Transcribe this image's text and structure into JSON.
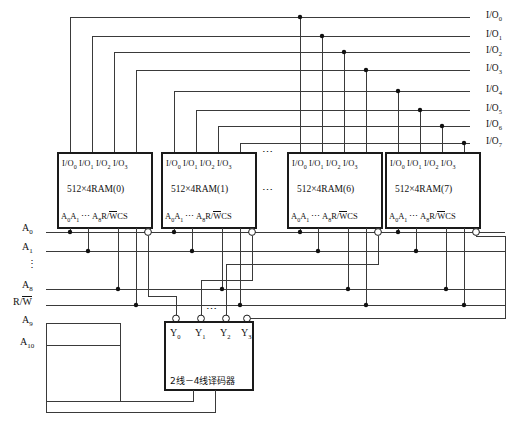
{
  "diagram": {
    "bus_right_labels": [
      {
        "text": "I/O",
        "sub": "0",
        "y": 17
      },
      {
        "text": "I/O",
        "sub": "1",
        "y": 36
      },
      {
        "text": "I/O",
        "sub": "2",
        "y": 52
      },
      {
        "text": "I/O",
        "sub": "3",
        "y": 70
      },
      {
        "text": "I/O",
        "sub": "4",
        "y": 91
      },
      {
        "text": "I/O",
        "sub": "5",
        "y": 110
      },
      {
        "text": "I/O",
        "sub": "6",
        "y": 126
      },
      {
        "text": "I/O",
        "sub": "7",
        "y": 143
      }
    ],
    "left_signals": [
      {
        "text": "A",
        "sub": "0",
        "y": 228,
        "overline": false
      },
      {
        "text": "A",
        "sub": "1",
        "y": 247,
        "overline": false
      },
      {
        "text": "A",
        "sub": "8",
        "y": 285,
        "overline": false
      },
      {
        "text": "R/W",
        "sub": "",
        "y": 302,
        "overline": true
      },
      {
        "text": "A",
        "sub": "9",
        "y": 320,
        "overline": false
      },
      {
        "text": "A",
        "sub": "10",
        "y": 342,
        "overline": false
      }
    ],
    "left_vertical_dots": {
      "glyph": "⋮",
      "y": 265
    },
    "rams": [
      {
        "index": "0",
        "label": "512×4RAM(0)",
        "x": 58,
        "y": 153,
        "w": 94,
        "h": 75
      },
      {
        "index": "1",
        "label": "512×4RAM(1)",
        "x": 162,
        "y": 153,
        "w": 94,
        "h": 75
      },
      {
        "index": "6",
        "label": "512×4RAM(6)",
        "x": 288,
        "y": 153,
        "w": 94,
        "h": 75
      },
      {
        "index": "7",
        "label": "512×4RAM(7)",
        "x": 386,
        "y": 153,
        "w": 94,
        "h": 75
      }
    ],
    "ram_io_pins": [
      "I/O₀",
      "I/O₁",
      "I/O₂",
      "I/O₃"
    ],
    "ram_io_text": "I/O₀  I/O₁ I/O₂ I/O₃",
    "ram_addr_text": "A₀A₁  ⋯  A₈ R/W̅CS",
    "ram_addr_parts": {
      "a0": "A",
      "a0s": "0",
      "a1": "A",
      "a1s": "1",
      "mid": "⋯",
      "a8": "A",
      "a8s": "8",
      "rw": "R/W",
      "cs": "CS"
    },
    "ellipsis_between_rams": [
      {
        "glyph": "⋯",
        "x": 264,
        "y": 152
      },
      {
        "glyph": "⋯",
        "x": 264,
        "y": 190
      }
    ],
    "decoder": {
      "caption": "2线－4线译码器",
      "x": 165,
      "y": 322,
      "w": 88,
      "h": 68,
      "outputs": [
        {
          "label": "Y",
          "sub": "0"
        },
        {
          "label": "Y",
          "sub": "1"
        },
        {
          "label": "Y",
          "sub": "2"
        },
        {
          "label": "Y",
          "sub": "3"
        }
      ],
      "output_dots": {
        "glyph": "⋯",
        "x": 200,
        "y": 312
      }
    },
    "colors": {
      "wire": "#3a3a3a",
      "box_stroke": "#1a1a1a",
      "junction": "#111111",
      "background": "#ffffff",
      "text": "#111111"
    }
  }
}
